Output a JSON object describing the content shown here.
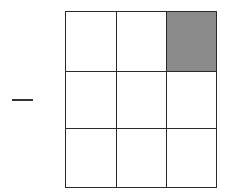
{
  "figure": {
    "type": "grid-puzzle",
    "prefix_symbol": "minus-sign",
    "rows": 3,
    "cols": 3,
    "cells": [
      {
        "row": 0,
        "col": 0,
        "shaded": false
      },
      {
        "row": 0,
        "col": 1,
        "shaded": false
      },
      {
        "row": 0,
        "col": 2,
        "shaded": true
      },
      {
        "row": 1,
        "col": 0,
        "shaded": false
      },
      {
        "row": 1,
        "col": 1,
        "shaded": false
      },
      {
        "row": 1,
        "col": 2,
        "shaded": false
      },
      {
        "row": 2,
        "col": 0,
        "shaded": false
      },
      {
        "row": 2,
        "col": 1,
        "shaded": false
      },
      {
        "row": 2,
        "col": 2,
        "shaded": false
      }
    ],
    "colors": {
      "line": "#2a2a2a",
      "shade": "#8a8a8a",
      "background": "#ffffff"
    }
  }
}
